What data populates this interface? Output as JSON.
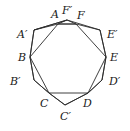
{
  "diagram": {
    "type": "geometry",
    "colors": {
      "stroke": "#2a2a2a",
      "text": "#1a1a1a",
      "background": "#ffffff"
    },
    "points": {
      "A": {
        "label": "A",
        "x": 58,
        "y": 24
      },
      "F'": {
        "label": "F′",
        "x": 67,
        "y": 20
      },
      "F": {
        "label": "F",
        "x": 76,
        "y": 24
      },
      "A'": {
        "label": "A′",
        "x": 34,
        "y": 30
      },
      "E'": {
        "label": "E′",
        "x": 100,
        "y": 30
      },
      "B": {
        "label": "B",
        "x": 30,
        "y": 57
      },
      "E": {
        "label": "E",
        "x": 106,
        "y": 57
      },
      "B'": {
        "label": "B′",
        "x": 34,
        "y": 80
      },
      "D'": {
        "label": "D′",
        "x": 102,
        "y": 80
      },
      "C": {
        "label": "C",
        "x": 49,
        "y": 93
      },
      "D": {
        "label": "D",
        "x": 88,
        "y": 93
      },
      "C'": {
        "label": "C′",
        "x": 65,
        "y": 105
      }
    },
    "labels": {
      "A": "A",
      "Fp": "F′",
      "F": "F",
      "Ap": "A′",
      "Ep": "E′",
      "B": "B",
      "E": "E",
      "Bp": "B′",
      "Dp": "D′",
      "C": "C",
      "D": "D",
      "Cp": "C′"
    },
    "polygons": {
      "inner": [
        "A",
        "B",
        "C",
        "D",
        "E",
        "F"
      ],
      "outer": [
        "A'",
        "F'",
        "E'",
        "E",
        "D'",
        "D",
        "C'",
        "C",
        "B'",
        "B"
      ],
      "intermediate": [
        "F'",
        "A'",
        "B",
        "B'",
        "C",
        "C'",
        "D",
        "D'",
        "E",
        "E'"
      ]
    }
  }
}
